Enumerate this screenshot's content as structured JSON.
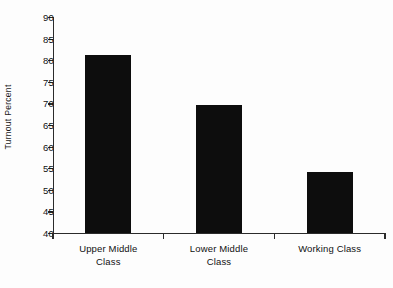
{
  "chart_data": {
    "type": "bar",
    "title": "",
    "subtitle": "",
    "xlabel": "",
    "ylabel": "Turnout Percent",
    "categories": [
      "Upper Middle Class",
      "Lower Middle Class",
      "Working Class"
    ],
    "values": [
      81.3,
      69.7,
      54.1
    ],
    "ylim": [
      40,
      90
    ],
    "ytick_step": 5,
    "yticks": [
      90,
      85,
      80,
      75,
      70,
      65,
      60,
      55,
      50,
      45,
      40
    ],
    "ytick_labels": [
      "90",
      "85",
      "80",
      "75",
      "70",
      "65",
      "60",
      "55",
      "50",
      "45",
      "40"
    ],
    "category_lines": [
      [
        "Upper Middle",
        "Class"
      ],
      [
        "Lower Middle",
        "Class"
      ],
      [
        "Working Class"
      ]
    ],
    "grid": false,
    "legend": false,
    "legend_position": "none",
    "bar_color": "#0d0d0d",
    "axis_color": "#2b2b2b",
    "background_color": "#fdfdfd",
    "annotations": []
  }
}
